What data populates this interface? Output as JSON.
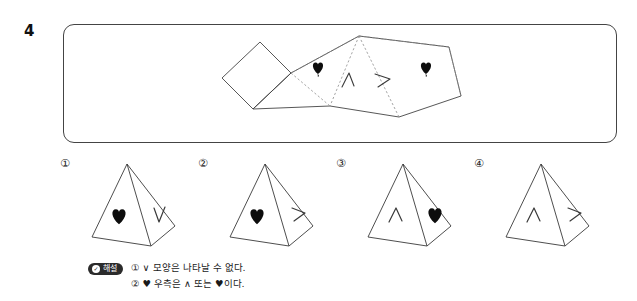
{
  "question": {
    "number": "4"
  },
  "stimulus": {
    "name": "pyramid-net",
    "description": "square pyramid net with heart and chevron marks",
    "marks": [
      {
        "id": "heart-left",
        "glyph": "heart",
        "face": "lateral-2"
      },
      {
        "id": "chevron-up",
        "glyph": "^",
        "face": "lateral-3"
      },
      {
        "id": "chevron-right",
        "glyph": ">",
        "face": "lateral-4"
      },
      {
        "id": "heart-right",
        "glyph": "heart",
        "face": "lateral-5"
      }
    ]
  },
  "options": [
    {
      "label": "①",
      "name": "option-1",
      "front_mark": "heart",
      "right_mark": "∨"
    },
    {
      "label": "②",
      "name": "option-2",
      "front_mark": "heart",
      "right_mark": ">"
    },
    {
      "label": "③",
      "name": "option-3",
      "front_mark": "∧",
      "right_mark": "heart"
    },
    {
      "label": "④",
      "name": "option-4",
      "front_mark": "∧",
      "right_mark": ">"
    }
  ],
  "explanation": {
    "badge_check": "✓",
    "badge_label": "해설",
    "lines": [
      "① ∨ 모양은 나타날 수 없다.",
      "② ♥ 우측은 ∧ 또는 ♥이다."
    ]
  },
  "colors": {
    "ink": "#1a1a1a",
    "line": "#444444",
    "dashed": "#8a8a8a",
    "badge_bg": "#2b2b2b"
  }
}
